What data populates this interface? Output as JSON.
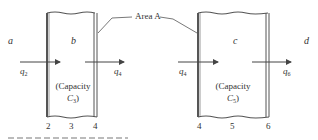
{
  "diagram": {
    "regions": {
      "a": "a",
      "b": "b",
      "c": "c",
      "d": "d"
    },
    "callout": {
      "label": "Area A"
    },
    "left_box": {
      "capacity_line1": "(Capacity",
      "capacity_symbol": "C",
      "capacity_subscript": "3",
      "capacity_close": ")",
      "positions": [
        "2",
        "3",
        "4"
      ]
    },
    "right_box": {
      "capacity_line1": "(Capacity",
      "capacity_symbol": "C",
      "capacity_subscript": "5",
      "capacity_close": ")",
      "positions": [
        "4",
        "5",
        "6"
      ]
    },
    "flows": [
      {
        "symbol": "q",
        "subscript": "2"
      },
      {
        "symbol": "q",
        "subscript": "4"
      },
      {
        "symbol": "q",
        "subscript": "4"
      },
      {
        "symbol": "q",
        "subscript": "6"
      }
    ],
    "colors": {
      "line": "#444444",
      "text": "#333333",
      "background": "#ffffff"
    }
  }
}
